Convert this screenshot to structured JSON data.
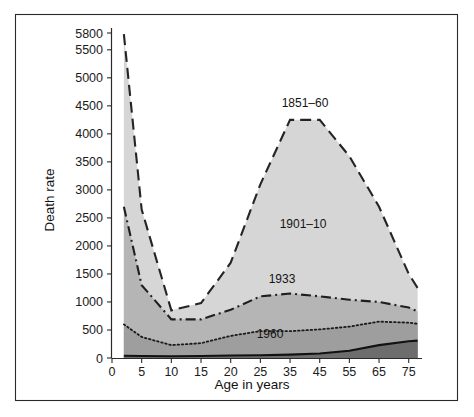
{
  "figure": {
    "frame": {
      "border_color": "#2a2a2a"
    },
    "background": "#ffffff"
  },
  "chart_data": {
    "type": "area",
    "title": "",
    "subtitle": "",
    "xlabel": "Age in years",
    "ylabel": "Death rate",
    "grid": false,
    "legend_position": "inline-annotations",
    "stacked": true,
    "xlim": [
      0,
      80
    ],
    "ylim": [
      0,
      5800
    ],
    "x_tick_labels": [
      "0",
      "5",
      "10",
      "15",
      "20",
      "25",
      "35",
      "45",
      "55",
      "65",
      "75"
    ],
    "x_tick_values": [
      0,
      5,
      10,
      15,
      20,
      25,
      35,
      45,
      55,
      65,
      75
    ],
    "y_tick_labels": [
      "0",
      "500",
      "1000",
      "1500",
      "2000",
      "2500",
      "3000",
      "3500",
      "4000",
      "4500",
      "5000",
      "5500",
      "5800"
    ],
    "y_tick_values": [
      0,
      500,
      1000,
      1500,
      2000,
      2500,
      3000,
      3500,
      4000,
      4500,
      5000,
      5500,
      5800
    ],
    "x": [
      2,
      5,
      10,
      15,
      20,
      25,
      35,
      45,
      55,
      65,
      75,
      78
    ],
    "series": [
      {
        "name": "1851–60",
        "label": "1851–60",
        "line_style": "dashed",
        "band_color": "#d6d6d6",
        "line_color": "#242424",
        "values": [
          5750,
          2300,
          700,
          800,
          1100,
          1300,
          1400,
          1300,
          1100,
          900,
          700,
          620
        ]
      },
      {
        "name": "1901–10",
        "label": "1901–10",
        "line_style": "dash-dot",
        "band_color": "#b5b5b5",
        "line_color": "#1f1f1f",
        "values": [
          2700,
          1250,
          560,
          620,
          760,
          900,
          900,
          860,
          780,
          700,
          560,
          520
        ]
      },
      {
        "name": "1933",
        "label": "1933",
        "line_style": "dotted",
        "band_color": "#9e9e9e",
        "line_color": "#1a1a1a",
        "values": [
          560,
          340,
          200,
          230,
          350,
          430,
          420,
          430,
          430,
          420,
          330,
          300
        ]
      },
      {
        "name": "1960",
        "label": "1960",
        "line_style": "solid",
        "band_color": "#6d6d6d",
        "line_color": "#121212",
        "values": [
          40,
          35,
          30,
          35,
          45,
          50,
          60,
          80,
          130,
          230,
          300,
          310
        ]
      }
    ],
    "cumulative_totals": {
      "1960": [
        40,
        35,
        30,
        35,
        45,
        50,
        60,
        80,
        130,
        230,
        300,
        310
      ],
      "1933": [
        600,
        375,
        230,
        265,
        395,
        480,
        480,
        510,
        560,
        650,
        630,
        610
      ],
      "1901–10": [
        2700,
        1300,
        690,
        690,
        860,
        1100,
        1150,
        1100,
        1040,
        1000,
        900,
        830
      ],
      "1851–60": [
        5780,
        2650,
        850,
        980,
        1700,
        3100,
        4250,
        4250,
        3600,
        2700,
        1500,
        1250
      ]
    },
    "annotations": [
      {
        "text": "1851–60",
        "x_px": 305,
        "y_px": 107
      },
      {
        "text": "1901–10",
        "x_px": 303,
        "y_px": 228
      },
      {
        "text": "1933",
        "x_px": 282,
        "y_px": 283
      },
      {
        "text": "1960",
        "x_px": 270,
        "y_px": 338
      }
    ]
  }
}
